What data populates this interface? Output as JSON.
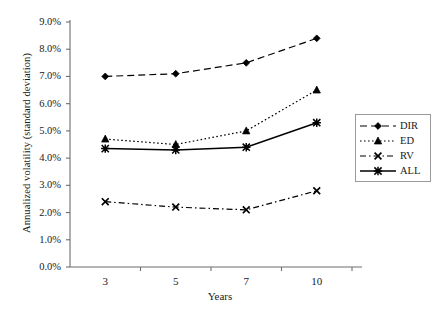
{
  "chart_data": {
    "type": "line",
    "title": "",
    "xlabel": "Years",
    "ylabel": "Annualized volatility (standard deviation)",
    "categories": [
      "3",
      "5",
      "7",
      "10"
    ],
    "x": [
      3,
      5,
      7,
      10
    ],
    "ylim": [
      0,
      9
    ],
    "ytick_labels": [
      "9.0%",
      "8.0%",
      "7.0%",
      "6.0%",
      "5.0%",
      "4.0%",
      "3.0%",
      "2.0%",
      "1.0%",
      "0.0%"
    ],
    "ytick_values": [
      9,
      8,
      7,
      6,
      5,
      4,
      3,
      2,
      1,
      0
    ],
    "grid": false,
    "legend_position": "right-middle",
    "units": "percent",
    "series": [
      {
        "name": "DIR",
        "values": [
          7.0,
          7.1,
          7.5,
          8.4
        ],
        "marker": "diamond",
        "line_style": "dashed",
        "color": "#000000"
      },
      {
        "name": "ED",
        "values": [
          4.7,
          4.5,
          5.0,
          6.5
        ],
        "marker": "triangle",
        "line_style": "dotted",
        "color": "#000000"
      },
      {
        "name": "RV",
        "values": [
          2.4,
          2.2,
          2.1,
          2.8
        ],
        "marker": "x",
        "line_style": "dash-dot",
        "color": "#000000"
      },
      {
        "name": "ALL",
        "values": [
          4.35,
          4.3,
          4.4,
          5.3
        ],
        "marker": "asterisk",
        "line_style": "solid",
        "color": "#000000"
      }
    ]
  },
  "axes": {
    "y_title": "Annualized volatility (standard deviation)",
    "x_title": "Years",
    "y_ticks": [
      {
        "label": "9.0%",
        "value": 9
      },
      {
        "label": "8.0%",
        "value": 8
      },
      {
        "label": "7.0%",
        "value": 7
      },
      {
        "label": "6.0%",
        "value": 6
      },
      {
        "label": "5.0%",
        "value": 5
      },
      {
        "label": "4.0%",
        "value": 4
      },
      {
        "label": "3.0%",
        "value": 3
      },
      {
        "label": "2.0%",
        "value": 2
      },
      {
        "label": "1.0%",
        "value": 1
      },
      {
        "label": "0.0%",
        "value": 0
      }
    ],
    "x_ticks": [
      {
        "label": "3"
      },
      {
        "label": "5"
      },
      {
        "label": "7"
      },
      {
        "label": "10"
      }
    ],
    "axis_color": "#6d6d6d"
  },
  "legend": {
    "items": [
      {
        "label": "DIR",
        "marker": "diamond",
        "line_style": "dashed"
      },
      {
        "label": "ED",
        "marker": "triangle",
        "line_style": "dotted"
      },
      {
        "label": "RV",
        "marker": "x",
        "line_style": "dash-dot"
      },
      {
        "label": "ALL",
        "marker": "asterisk",
        "line_style": "solid"
      }
    ],
    "border_color": "#9a9a9a"
  }
}
